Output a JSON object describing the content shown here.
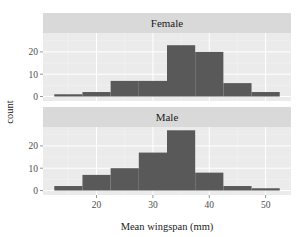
{
  "chart_data": {
    "type": "bar",
    "subtype": "faceted-histogram",
    "xlabel": "Mean wingspan (mm)",
    "ylabel": "count",
    "bin_width": 5,
    "bin_edges": [
      12.5,
      17.5,
      22.5,
      27.5,
      32.5,
      37.5,
      42.5,
      47.5,
      52.5
    ],
    "xlim": [
      10.5,
      54.5
    ],
    "ylim": [
      0,
      28
    ],
    "x_ticks": [
      20,
      30,
      40,
      50
    ],
    "x_tick_labels": [
      "20",
      "30",
      "40",
      "50"
    ],
    "y_ticks": [
      0,
      10,
      20
    ],
    "y_tick_labels": [
      "0",
      "10",
      "20"
    ],
    "grid": true,
    "legend": "none",
    "bar_color": "#595959",
    "panel_background": "#ebebeb",
    "strip_background": "#d9d9d9",
    "facets": [
      {
        "name": "Female",
        "values": [
          1,
          2,
          7,
          7,
          23,
          20,
          6,
          2
        ]
      },
      {
        "name": "Male",
        "values": [
          2,
          7,
          10,
          17,
          27,
          8,
          2,
          1
        ]
      }
    ]
  }
}
